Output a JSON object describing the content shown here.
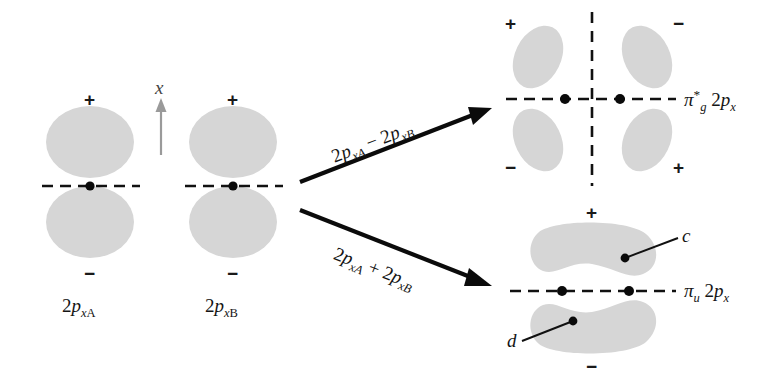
{
  "figure": {
    "background_color": "#ffffff",
    "lobe_fill_color": "#d6d6d6",
    "line_color": "#111111",
    "axis_arrow_color": "#9a9a9a"
  },
  "axis_indicator": {
    "label": "x",
    "direction": "up"
  },
  "atomic_orbitals": [
    {
      "id": "2pxA",
      "label_prefix": "2",
      "label_p": "p",
      "label_sub_x": "x",
      "label_sub_atom": "A",
      "top_sign": "+",
      "bottom_sign": "−"
    },
    {
      "id": "2pxB",
      "label_prefix": "2",
      "label_p": "p",
      "label_sub_x": "x",
      "label_sub_atom": "B",
      "top_sign": "+",
      "bottom_sign": "−"
    }
  ],
  "combinations": [
    {
      "id": "antibonding",
      "expression_prefix": "2",
      "expression": "2p xA − 2p xB",
      "term1_num": "2",
      "term1_p": "p",
      "term1_sub": "xA",
      "operator": "−",
      "term2_num": "2",
      "term2_p": "p",
      "term2_sub": "xB",
      "arrow_direction": "up-right"
    },
    {
      "id": "bonding",
      "expression": "2p xA + 2p xB",
      "term1_num": "2",
      "term1_p": "p",
      "term1_sub": "xA",
      "operator": "+",
      "term2_num": "2",
      "term2_p": "p",
      "term2_sub": "xB",
      "arrow_direction": "down-right"
    }
  ],
  "molecular_orbitals": [
    {
      "id": "pi-star-g",
      "symbol": "π",
      "superscript": "*",
      "subscript": "g",
      "suffix_num": "2",
      "suffix_p": "p",
      "suffix_sub": "x",
      "full_label": "π*g 2px",
      "type": "antibonding",
      "lobes": [
        {
          "position": "top-left",
          "sign": "+"
        },
        {
          "position": "top-right",
          "sign": "−"
        },
        {
          "position": "bottom-left",
          "sign": "−"
        },
        {
          "position": "bottom-right",
          "sign": "+"
        }
      ],
      "nodal_plane": "vertical-dashed",
      "nuclei_count": 2
    },
    {
      "id": "pi-u",
      "symbol": "π",
      "superscript": "",
      "subscript": "u",
      "suffix_num": "2",
      "suffix_p": "p",
      "suffix_sub": "x",
      "full_label": "πu 2px",
      "type": "bonding",
      "lobes": [
        {
          "position": "top",
          "sign": "+",
          "callout": "c"
        },
        {
          "position": "bottom",
          "sign": "−",
          "callout": "d"
        }
      ],
      "nodal_plane": "horizontal-dashed",
      "nuclei_count": 2
    }
  ],
  "callouts": [
    {
      "id": "c",
      "letter": "c",
      "target": "top-lobe-of-pi-u"
    },
    {
      "id": "d",
      "letter": "d",
      "target": "bottom-lobe-of-pi-u"
    }
  ]
}
